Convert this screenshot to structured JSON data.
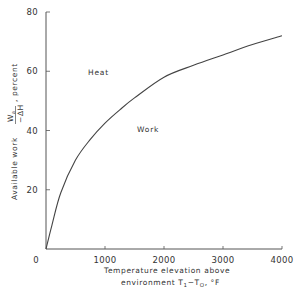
{
  "chart_data": {
    "type": "line",
    "title": "",
    "xlabel": "Temperature elevation above environment T₁−T₀, °F",
    "xlabel_line1": "Temperature  elevation  above",
    "xlabel_line2": "environment  T",
    "ylabel": "Available work Wa/−ΔH , percent",
    "ylabel_prefix": "Available  work",
    "ylabel_frac_num": "W",
    "ylabel_frac_num_sub": "a",
    "ylabel_frac_den": "−ΔH",
    "ylabel_suffix": ",  percent",
    "xlim": [
      0,
      4000
    ],
    "ylim": [
      0,
      80
    ],
    "x_ticks": [
      0,
      1000,
      2000,
      3000,
      4000
    ],
    "x_tick_labels": [
      "0",
      "1000",
      "2000",
      "3000",
      "4000"
    ],
    "y_ticks": [
      20,
      40,
      60,
      80
    ],
    "y_tick_labels": [
      "20",
      "40",
      "60",
      "80"
    ],
    "grid": false,
    "annotations": [
      {
        "text": "Heat",
        "x": 700,
        "y": 59
      },
      {
        "text": "Work",
        "x": 1600,
        "y": 41
      }
    ],
    "series": [
      {
        "name": "Available work",
        "x": [
          0,
          100,
          250,
          500,
          750,
          1000,
          1250,
          1500,
          2000,
          2500,
          3000,
          3500,
          4000
        ],
        "values": [
          0,
          8,
          19,
          30,
          37,
          42.5,
          47,
          51,
          58,
          62,
          65.5,
          69,
          72
        ]
      }
    ],
    "legend": null
  },
  "labels": {
    "heat": "Heat",
    "work": "Work",
    "x_sub_1": "1",
    "x_mid": "−T",
    "x_sub_0": "O",
    "x_unit": ", °F"
  }
}
